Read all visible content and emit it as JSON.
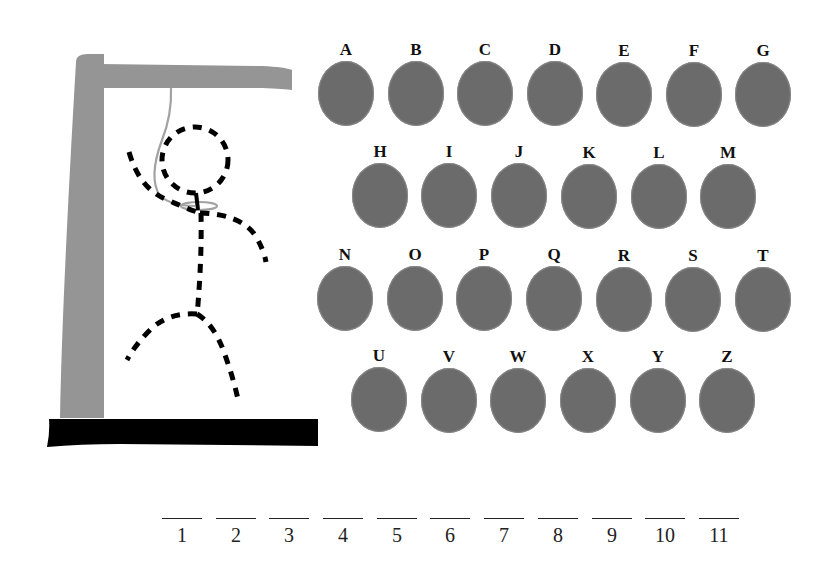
{
  "game": {
    "type": "hangman",
    "colors": {
      "key_fill": "#6b6b6b",
      "gallows": "#959595",
      "base": "#000000",
      "figure": "#000000",
      "rope": "#a0a0a0"
    }
  },
  "keyboard": {
    "rows": [
      [
        "A",
        "B",
        "C",
        "D",
        "E",
        "F",
        "G"
      ],
      [
        "H",
        "I",
        "J",
        "K",
        "L",
        "M"
      ],
      [
        "N",
        "O",
        "P",
        "Q",
        "R",
        "S",
        "T"
      ],
      [
        "U",
        "V",
        "W",
        "X",
        "Y",
        "Z"
      ]
    ],
    "keys": {
      "A": "A",
      "B": "B",
      "C": "C",
      "D": "D",
      "E": "E",
      "F": "F",
      "G": "G",
      "H": "H",
      "I": "I",
      "J": "J",
      "K": "K",
      "L": "L",
      "M": "M",
      "N": "N",
      "O": "O",
      "P": "P",
      "Q": "Q",
      "R": "R",
      "S": "S",
      "T": "T",
      "U": "U",
      "V": "V",
      "W": "W",
      "X": "X",
      "Y": "Y",
      "Z": "Z"
    }
  },
  "word": {
    "length": 11,
    "slots": [
      "1",
      "2",
      "3",
      "4",
      "5",
      "6",
      "7",
      "8",
      "9",
      "10",
      "11"
    ]
  },
  "figure": {
    "parts": [
      "head",
      "body",
      "left-arm",
      "right-arm",
      "left-leg",
      "right-leg"
    ],
    "style": "dashed"
  }
}
